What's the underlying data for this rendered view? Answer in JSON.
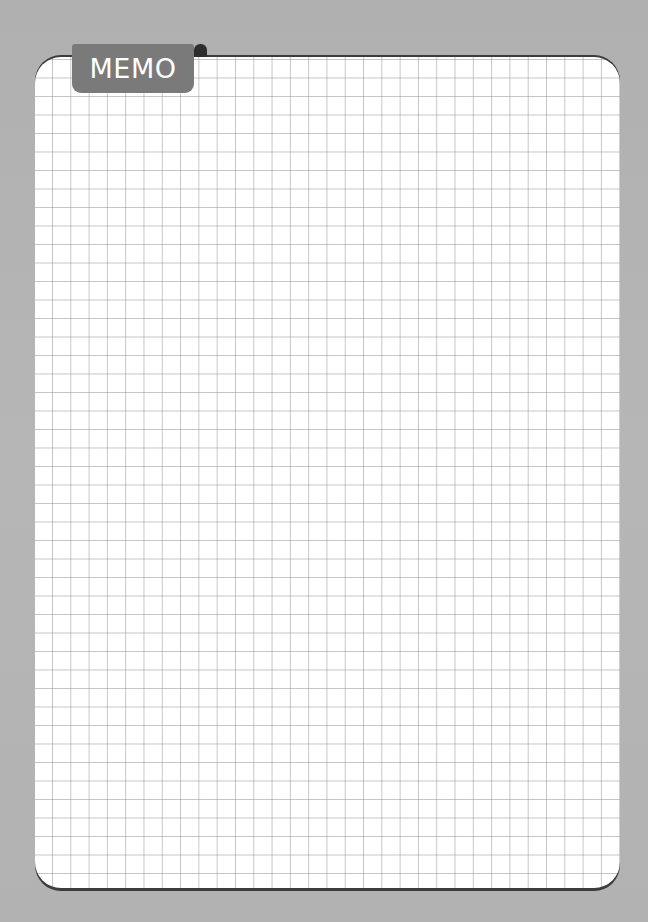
{
  "memo": {
    "tab_label": "MEMO",
    "sheet_type": "grid-paper",
    "grid": {
      "columns": 32,
      "rows": 45
    }
  },
  "colors": {
    "background": "#b4b4b4",
    "paper": "#ffffff",
    "grid_line": "#969696",
    "tab_fill": "#7a7a7a",
    "tab_text": "#ffffff",
    "border_shadow": "#3c3c3c"
  }
}
